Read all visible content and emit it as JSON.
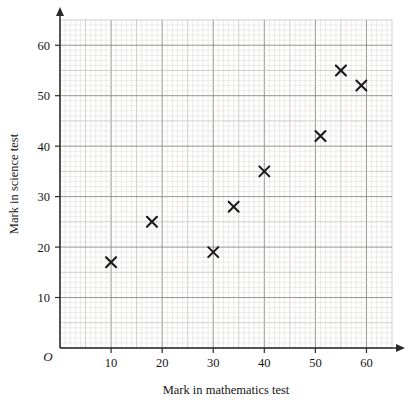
{
  "chart_data": {
    "type": "scatter",
    "title": "",
    "xlabel": "Mark in mathematics test",
    "ylabel": "Mark in science test",
    "origin_label": "O",
    "xlim": [
      0,
      65
    ],
    "ylim": [
      0,
      65
    ],
    "xticks": [
      10,
      20,
      30,
      40,
      50,
      60
    ],
    "yticks": [
      10,
      20,
      30,
      40,
      50,
      60
    ],
    "xtick_labels": [
      "10",
      "20",
      "30",
      "40",
      "50",
      "60"
    ],
    "ytick_labels": [
      "10",
      "20",
      "30",
      "40",
      "50",
      "60"
    ],
    "grid": true,
    "grid_minor_step": 1,
    "grid_mid_step": 5,
    "grid_major_step": 10,
    "legend": null,
    "marker": "cross-x",
    "points": [
      {
        "x": 10,
        "y": 17
      },
      {
        "x": 18,
        "y": 25
      },
      {
        "x": 30,
        "y": 19
      },
      {
        "x": 34,
        "y": 28
      },
      {
        "x": 40,
        "y": 35
      },
      {
        "x": 51,
        "y": 42
      },
      {
        "x": 55,
        "y": 55
      },
      {
        "x": 59,
        "y": 52
      }
    ],
    "x": [
      10,
      18,
      30,
      34,
      40,
      51,
      55,
      59
    ],
    "values": [
      17,
      25,
      19,
      28,
      35,
      42,
      55,
      52
    ]
  },
  "colors": {
    "axis": "#2b2b2b",
    "marker": "#1a1a1a",
    "grid_minor": "#d9d3d0",
    "grid_mid": "#c0b9b6",
    "grid_major": "#8d8784",
    "background": "#ffffff"
  }
}
